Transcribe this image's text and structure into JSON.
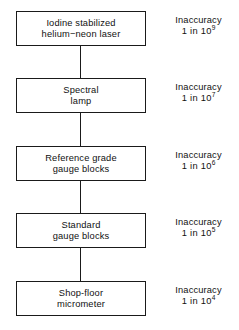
{
  "diagram": {
    "type": "flowchart-vertical-chain",
    "background_color": "#ffffff",
    "line_color": "#1a1a1a",
    "text_color": "#111111",
    "stages": [
      {
        "box_lines": [
          "Iodine stabilized",
          "helium−neon laser"
        ],
        "accuracy_label": "Inaccuracy",
        "accuracy_prefix": "1 in 10",
        "accuracy_exponent": "9"
      },
      {
        "box_lines": [
          "Spectral",
          "lamp"
        ],
        "accuracy_label": "Inaccuracy",
        "accuracy_prefix": "1 in 10",
        "accuracy_exponent": "7"
      },
      {
        "box_lines": [
          "Reference grade",
          "gauge blocks"
        ],
        "accuracy_label": "Inaccuracy",
        "accuracy_prefix": "1 in 10",
        "accuracy_exponent": "6"
      },
      {
        "box_lines": [
          "Standard",
          "gauge blocks"
        ],
        "accuracy_label": "Inaccuracy",
        "accuracy_prefix": "1 in 10",
        "accuracy_exponent": "5"
      },
      {
        "box_lines": [
          "Shop-floor",
          "micrometer"
        ],
        "accuracy_label": "Inaccuracy",
        "accuracy_prefix": "1 in 10",
        "accuracy_exponent": "4"
      }
    ]
  }
}
